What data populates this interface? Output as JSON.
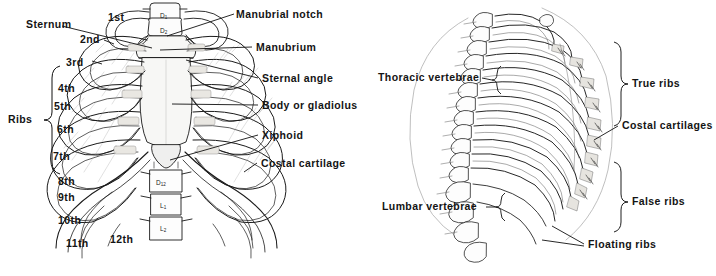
{
  "figure": {
    "background_color": "#ffffff",
    "ink_color": "#141414",
    "panels": [
      {
        "name": "anterior-view",
        "view": "anterior",
        "labels_left": [
          {
            "text": "1st",
            "x": 108,
            "y": 12
          },
          {
            "text": "Sternum",
            "x": 26,
            "y": 19
          },
          {
            "text": "2nd",
            "x": 80,
            "y": 34
          },
          {
            "text": "3rd",
            "x": 66,
            "y": 57
          },
          {
            "text": "4th",
            "x": 58,
            "y": 83
          },
          {
            "text": "5th",
            "x": 54,
            "y": 101
          },
          {
            "text": "6th",
            "x": 57,
            "y": 124
          },
          {
            "text": "7th",
            "x": 53,
            "y": 151
          },
          {
            "text": "8th",
            "x": 58,
            "y": 176
          },
          {
            "text": "9th",
            "x": 58,
            "y": 192
          },
          {
            "text": "10th",
            "x": 58,
            "y": 215
          },
          {
            "text": "11th",
            "x": 66,
            "y": 238
          },
          {
            "text": "12th",
            "x": 110,
            "y": 234
          },
          {
            "text": "Ribs",
            "x": 8,
            "y": 116
          }
        ],
        "labels_right": [
          {
            "text": "Manubrial notch",
            "x": 236,
            "y": 9
          },
          {
            "text": "Manubrium",
            "x": 256,
            "y": 42
          },
          {
            "text": "Sternal angle",
            "x": 262,
            "y": 73
          },
          {
            "text": "Body or gladiolus",
            "x": 262,
            "y": 100
          },
          {
            "text": "Xiphoid",
            "x": 262,
            "y": 130
          },
          {
            "text": "Costal cartilage",
            "x": 261,
            "y": 158
          }
        ],
        "vertebra_labels": [
          {
            "body": "D",
            "index": "1",
            "x": 160,
            "y": 14
          },
          {
            "body": "D",
            "index": "2",
            "x": 160,
            "y": 28
          },
          {
            "body": "D",
            "index": "12",
            "x": 156,
            "y": 182
          },
          {
            "body": "L",
            "index": "1",
            "x": 158,
            "y": 204
          },
          {
            "body": "L",
            "index": "2",
            "x": 158,
            "y": 226
          }
        ],
        "brace_label": "Ribs"
      },
      {
        "name": "lateral-view",
        "view": "lateral",
        "labels_left": [
          {
            "text": "Thoracic vertebrae",
            "x": 22,
            "y": 72
          },
          {
            "text": "Lumbar vertebrae",
            "x": 26,
            "y": 201
          }
        ],
        "labels_right": [
          {
            "text": "True ribs",
            "x": 276,
            "y": 80
          },
          {
            "text": "Costal cartilages",
            "x": 266,
            "y": 121
          },
          {
            "text": "False ribs",
            "x": 276,
            "y": 198
          }
        ],
        "labels_bottom": [
          {
            "text": "Floating ribs",
            "x": 232,
            "y": 240
          }
        ]
      }
    ]
  }
}
